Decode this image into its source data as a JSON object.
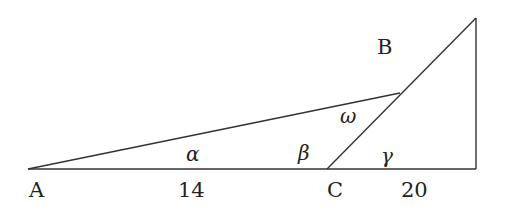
{
  "diagram": {
    "type": "geometry-triangle",
    "stroke_color": "#333333",
    "points": {
      "A": {
        "label": "A",
        "x": 28,
        "y": 169
      },
      "C": {
        "label": "C",
        "x": 327,
        "y": 169
      },
      "B": {
        "label": "B",
        "x": 400,
        "y": 93
      },
      "right_corner": {
        "x": 476,
        "y": 169
      },
      "top": {
        "x": 476,
        "y": 18
      }
    },
    "labels": {
      "A": "A",
      "B": "B",
      "C": "C",
      "len_AC": "14",
      "len_C_right": "20",
      "alpha": "α",
      "beta": "β",
      "gamma": "γ",
      "omega": "ω"
    }
  }
}
